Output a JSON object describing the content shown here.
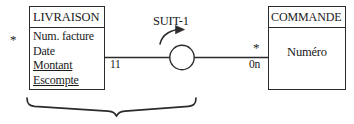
{
  "diagram": {
    "type": "entity-relationship-diagram",
    "entities": [
      {
        "name": "LIVRAISON",
        "attributes": [
          {
            "label": "Num. facture",
            "underlined": false
          },
          {
            "label": "Date",
            "underlined": false
          },
          {
            "label": "Montant",
            "underlined": true
          },
          {
            "label": "Escompte",
            "underlined": true
          }
        ],
        "marker": "*"
      },
      {
        "name": "COMMANDE",
        "attributes": [
          {
            "label": "Numéro",
            "underlined": false
          }
        ],
        "marker": "*"
      }
    ],
    "relationship": {
      "label": "SUIT-1",
      "shape": "circle",
      "arrow": "curved-arrow-right",
      "cardinality_left": "11",
      "cardinality_right": "0n"
    },
    "brace": {
      "orientation": "bottom",
      "spans_from": "LIVRAISON",
      "spans_to": "relationship"
    },
    "colors": {
      "stroke": "#2b2b2b",
      "text": "#1a1a1a",
      "background": "#ffffff"
    }
  }
}
